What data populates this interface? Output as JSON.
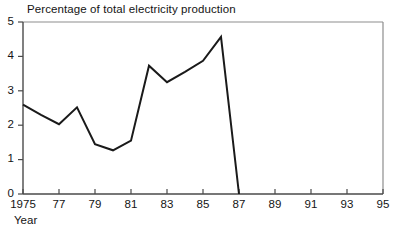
{
  "chart_data": {
    "type": "line",
    "title": "Percentage of total electricity production",
    "xlabel": "Year",
    "ylabel": "",
    "x": [
      1975,
      1976,
      1977,
      1978,
      1979,
      1980,
      1981,
      1982,
      1983,
      1984,
      1985,
      1986,
      1987
    ],
    "values": [
      2.6,
      2.3,
      2.03,
      2.52,
      1.45,
      1.27,
      1.55,
      3.73,
      3.25,
      3.55,
      3.87,
      4.57,
      0.0
    ],
    "series": [
      {
        "name": "Percentage of total electricity production",
        "values": [
          2.6,
          2.3,
          2.03,
          2.52,
          1.45,
          1.27,
          1.55,
          3.73,
          3.25,
          3.55,
          3.87,
          4.57,
          0.0
        ]
      }
    ],
    "xlim": [
      1975,
      1995
    ],
    "ylim": [
      0,
      5
    ],
    "x_tick_values": [
      1975,
      1977,
      1979,
      1981,
      1983,
      1985,
      1987,
      1989,
      1991,
      1993,
      1995
    ],
    "x_tick_labels": [
      "1975",
      "77",
      "79",
      "81",
      "83",
      "85",
      "87",
      "89",
      "91",
      "93",
      "95"
    ],
    "y_tick_values": [
      0,
      1,
      2,
      3,
      4,
      5
    ],
    "y_tick_labels": [
      "0",
      "1",
      "2",
      "3",
      "4",
      "5"
    ],
    "grid": false,
    "legend": false,
    "legend_position": "none",
    "line_color": "#1a1a1a",
    "axis_color": "#4d4d4d",
    "background_color": "#ffffff",
    "annotations": []
  },
  "axes": {
    "title": "Percentage of total electricity production",
    "xlabel": "Year"
  },
  "colors": {
    "line": "#1a1a1a",
    "axis": "#555555",
    "frame": "#888888",
    "text": "#141414",
    "background": "#ffffff"
  }
}
